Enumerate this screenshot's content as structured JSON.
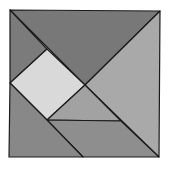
{
  "diagram": {
    "type": "tangram-square",
    "pieces": [
      {
        "name": "large-triangle-top",
        "fill": "#787878",
        "points": "10,10 160,11 85,85"
      },
      {
        "name": "small-triangle-left",
        "fill": "#7b7b7b",
        "points": "10,10 47,49 10,83"
      },
      {
        "name": "square",
        "fill": "#d9d9d9",
        "points": "47,49 85,85 47,120 10,83"
      },
      {
        "name": "large-triangle-right",
        "fill": "#a9a9a9",
        "points": "160,11 159,157 85,85"
      },
      {
        "name": "small-triangle-middle",
        "fill": "#a2a2a2",
        "points": "85,85 121,121 47,120"
      },
      {
        "name": "parallelogram-bottom",
        "fill": "#8e8e8e",
        "points": "47,120 121,121 159,157 83,157"
      },
      {
        "name": "medium-triangle-bottom-left",
        "fill": "#888888",
        "points": "10,83 47,120 83,157 9,157"
      }
    ],
    "stroke": "#1a1a1a"
  }
}
